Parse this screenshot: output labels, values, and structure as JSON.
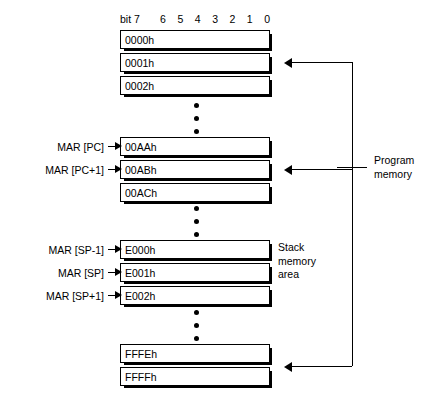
{
  "diagram": {
    "bit_header": {
      "first_label": "bit 7",
      "labels": [
        "6",
        "5",
        "4",
        "3",
        "2",
        "1",
        "0"
      ]
    },
    "blocks": [
      {
        "name": "top-block",
        "cells": [
          {
            "address": "0000h"
          },
          {
            "address": "0001h"
          },
          {
            "address": "0002h"
          }
        ]
      },
      {
        "name": "program-block",
        "cells": [
          {
            "address": "00AAh"
          },
          {
            "address": "00ABh"
          },
          {
            "address": "00ACh"
          }
        ]
      },
      {
        "name": "stack-block",
        "cells": [
          {
            "address": "E000h"
          },
          {
            "address": "E001h"
          },
          {
            "address": "E002h"
          }
        ]
      },
      {
        "name": "bottom-block",
        "cells": [
          {
            "address": "FFFEh"
          },
          {
            "address": "FFFFh"
          }
        ]
      }
    ],
    "mar_labels": [
      {
        "text": "MAR [PC]"
      },
      {
        "text": "MAR [PC+1]"
      },
      {
        "text": "MAR [SP-1]"
      },
      {
        "text": "MAR [SP]"
      },
      {
        "text": "MAR [SP+1]"
      }
    ],
    "side_labels": {
      "program_memory": "Program\nmemory",
      "stack_area": "Stack\nmemory\narea"
    },
    "colors": {
      "ink": "#000000",
      "paper": "#ffffff"
    }
  }
}
